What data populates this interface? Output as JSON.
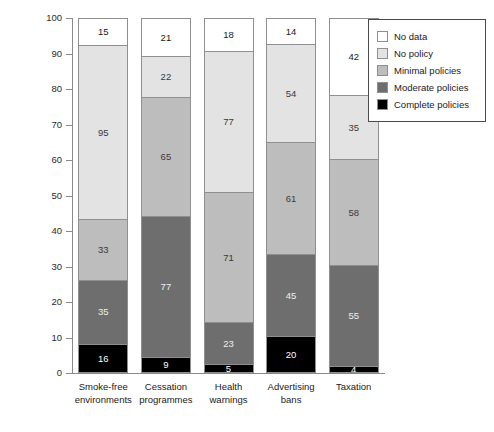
{
  "chart_data": {
    "type": "bar",
    "title": "",
    "subtitle": "",
    "xlabel": "",
    "ylabel": "% of countries",
    "ylim": [
      0,
      100
    ],
    "y_ticks": [
      0,
      10,
      20,
      30,
      40,
      50,
      60,
      70,
      80,
      90,
      100
    ],
    "grid": false,
    "stacked": true,
    "stack_total_countries": 194,
    "legend_position": "top-right",
    "categories": [
      "Smoke-free environments",
      "Cessation programmes",
      "Health warnings",
      "Advertising bans",
      "Taxation"
    ],
    "category_lines": [
      [
        "Smoke-free",
        "environments"
      ],
      [
        "Cessation",
        "programmes"
      ],
      [
        "Health",
        "warnings"
      ],
      [
        "Advertising",
        "bans"
      ],
      [
        "Taxation"
      ]
    ],
    "series": [
      {
        "name": "Complete policies",
        "color": "#000000",
        "label_color": "#ffffff",
        "values": [
          16,
          9,
          5,
          20,
          4
        ],
        "percents": [
          8.2,
          4.6,
          2.6,
          10.3,
          2.1
        ]
      },
      {
        "name": "Moderate policies",
        "color": "#6e6e6e",
        "label_color": "#efefef",
        "values": [
          35,
          77,
          23,
          45,
          55
        ],
        "percents": [
          18.0,
          39.7,
          11.9,
          23.2,
          28.4
        ]
      },
      {
        "name": "Minimal policies",
        "color": "#bdbdbd",
        "label_color": "#3a3a3a",
        "values": [
          33,
          65,
          71,
          61,
          58
        ],
        "percents": [
          17.0,
          33.5,
          36.6,
          31.4,
          29.9
        ]
      },
      {
        "name": "No policy",
        "color": "#e3e3e3",
        "label_color": "#3a3a3a",
        "values": [
          95,
          22,
          77,
          54,
          35
        ],
        "percents": [
          49.0,
          11.3,
          39.7,
          27.8,
          18.0
        ]
      },
      {
        "name": "No data",
        "color": "#ffffff",
        "label_color": "#1a1a1a",
        "values": [
          15,
          21,
          18,
          14,
          42
        ],
        "percents": [
          7.7,
          10.8,
          9.3,
          7.2,
          21.6
        ]
      }
    ]
  },
  "legend": {
    "items": [
      {
        "label": "No data",
        "color": "#ffffff"
      },
      {
        "label": "No policy",
        "color": "#e3e3e3"
      },
      {
        "label": "Minimal policies",
        "color": "#bdbdbd"
      },
      {
        "label": "Moderate policies",
        "color": "#6e6e6e"
      },
      {
        "label": "Complete policies",
        "color": "#000000"
      }
    ]
  }
}
